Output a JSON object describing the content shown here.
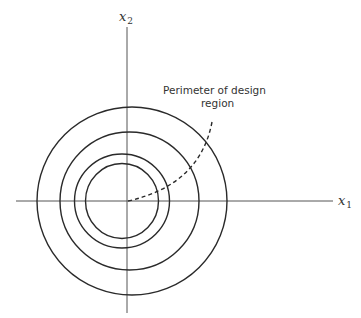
{
  "diagram": {
    "axes": {
      "x_label": "x",
      "x_subscript": "1",
      "y_label": "x",
      "y_subscript": "2",
      "origin": [
        127,
        201
      ],
      "x_axis_extent": [
        16,
        333
      ],
      "y_axis_extent": [
        27,
        313
      ]
    },
    "contours": [
      {
        "name": "contour-1",
        "cx": 122,
        "cy": 201,
        "rx": 36.5,
        "ry": 37.5
      },
      {
        "name": "contour-2",
        "cx": 122,
        "cy": 201,
        "rx": 47.5,
        "ry": 47
      },
      {
        "name": "contour-3",
        "cx": 129.5,
        "cy": 201,
        "rx": 69.5,
        "ry": 69
      },
      {
        "name": "contour-4",
        "cx": 132,
        "cy": 201,
        "rx": 95,
        "ry": 94
      }
    ],
    "annotation": {
      "line1": "Perimeter of design",
      "line2": "region"
    },
    "colors": {
      "stroke": "#2a2a2a",
      "axis": "#555555",
      "text": "#333333"
    }
  }
}
